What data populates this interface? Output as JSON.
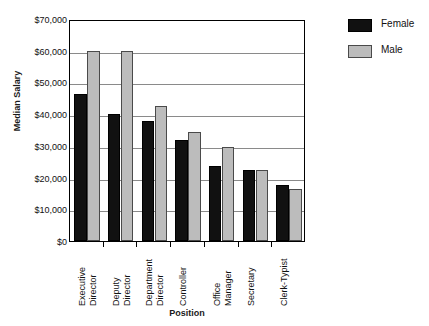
{
  "chart_data": {
    "type": "bar",
    "title": "",
    "xlabel": "Position",
    "ylabel": "Median Salary",
    "ylim": [
      0,
      70000
    ],
    "ytick_step": 10000,
    "grid": true,
    "legend_position": "right",
    "categories": [
      "Executive Director",
      "Deputy Director",
      "Department Director",
      "Controller",
      "Office Manager",
      "Secretary",
      "Clerk-Typist"
    ],
    "category_lines": [
      [
        "Executive",
        "Director"
      ],
      [
        "Deputy",
        "Director"
      ],
      [
        "Department",
        "Director"
      ],
      [
        "Controller",
        ""
      ],
      [
        "Office",
        "Manager"
      ],
      [
        "Secretary",
        ""
      ],
      [
        "Clerk-Typist",
        ""
      ]
    ],
    "series": [
      {
        "name": "Female",
        "color": "#111111",
        "values": [
          46500,
          40000,
          38000,
          31800,
          23800,
          22300,
          17700
        ]
      },
      {
        "name": "Male",
        "color": "#bcbcbc",
        "values": [
          60000,
          60000,
          42500,
          34300,
          29500,
          22400,
          16500
        ]
      }
    ],
    "ytick_labels": [
      "$70,000",
      "$60,000",
      "$50,000",
      "$40,000",
      "$30,000",
      "$20,000",
      "$10,000",
      "$0"
    ],
    "ytick_values": [
      70000,
      60000,
      50000,
      40000,
      30000,
      20000,
      10000,
      0
    ]
  },
  "legend": {
    "items": [
      {
        "label": "Female"
      },
      {
        "label": "Male"
      }
    ]
  },
  "axes": {
    "x_title": "Position",
    "y_title": "Median Salary"
  }
}
